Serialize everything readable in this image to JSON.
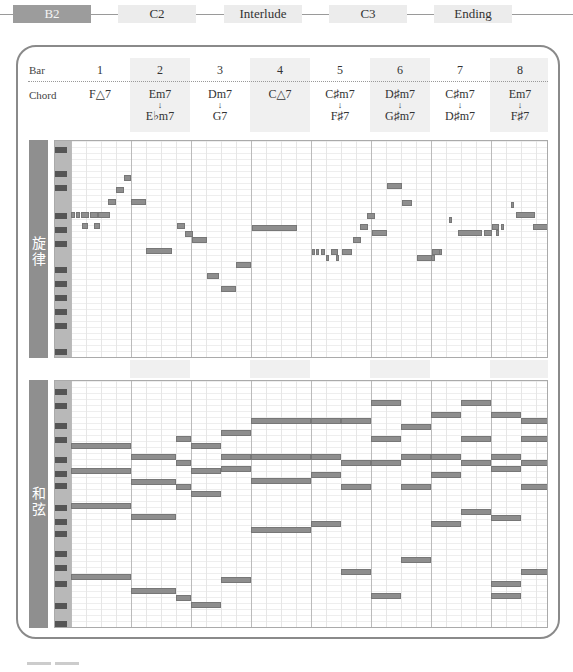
{
  "sections": [
    {
      "label": "B2",
      "active": true
    },
    {
      "label": "C2",
      "active": false
    },
    {
      "label": "Interlude",
      "active": false
    },
    {
      "label": "C3",
      "active": false
    },
    {
      "label": "Ending",
      "active": false
    }
  ],
  "header": {
    "bar_label": "Bar",
    "chord_label": "Chord",
    "bars": [
      "1",
      "2",
      "3",
      "4",
      "5",
      "6",
      "7",
      "8"
    ],
    "chords": [
      {
        "first": "F△7",
        "second": ""
      },
      {
        "first": "Em7",
        "second": "E♭m7"
      },
      {
        "first": "Dm7",
        "second": "G7"
      },
      {
        "first": "C△7",
        "second": ""
      },
      {
        "first": "C♯m7",
        "second": "F♯7"
      },
      {
        "first": "D♯m7",
        "second": "G♯m7"
      },
      {
        "first": "C♯m7",
        "second": "D♯m7"
      },
      {
        "first": "Em7",
        "second": "F♯7"
      }
    ],
    "arrow": "↓"
  },
  "melody": {
    "label_chars": [
      "旋",
      "律"
    ],
    "notes": [
      {
        "x": 0,
        "y": 71,
        "w": 4,
        "t": ""
      },
      {
        "x": 5,
        "y": 71,
        "w": 4,
        "t": ""
      },
      {
        "x": 10,
        "y": 71,
        "w": 8,
        "t": ""
      },
      {
        "x": 19,
        "y": 71,
        "w": 8,
        "t": ""
      },
      {
        "x": 27,
        "y": 71,
        "w": 12,
        "t": ""
      },
      {
        "x": 11,
        "y": 82,
        "w": 6,
        "t": ""
      },
      {
        "x": 23,
        "y": 82,
        "w": 6,
        "t": ""
      },
      {
        "x": 37,
        "y": 58,
        "w": 8,
        "t": ""
      },
      {
        "x": 45,
        "y": 46,
        "w": 8,
        "t": ""
      },
      {
        "x": 53,
        "y": 34,
        "w": 7,
        "t": ""
      },
      {
        "x": 60,
        "y": 58,
        "w": 15,
        "t": ""
      },
      {
        "x": 106,
        "y": 82,
        "w": 8,
        "t": ""
      },
      {
        "x": 114,
        "y": 90,
        "w": 8,
        "t": ""
      },
      {
        "x": 121,
        "y": 96,
        "w": 15,
        "t": ""
      },
      {
        "x": 75,
        "y": 107,
        "w": 26,
        "t": ""
      },
      {
        "x": 136,
        "y": 132,
        "w": 12,
        "t": ""
      },
      {
        "x": 150,
        "y": 145,
        "w": 15,
        "t": ""
      },
      {
        "x": 165,
        "y": 121,
        "w": 15,
        "t": ""
      },
      {
        "x": 181,
        "y": 84,
        "w": 45,
        "t": ""
      },
      {
        "x": 241,
        "y": 108,
        "w": 3,
        "t": ""
      },
      {
        "x": 245,
        "y": 108,
        "w": 3,
        "t": ""
      },
      {
        "x": 250,
        "y": 108,
        "w": 4,
        "t": ""
      },
      {
        "x": 255,
        "y": 114,
        "w": 3,
        "t": ""
      },
      {
        "x": 260,
        "y": 108,
        "w": 7,
        "t": ""
      },
      {
        "x": 265,
        "y": 114,
        "w": 3,
        "t": ""
      },
      {
        "x": 271,
        "y": 108,
        "w": 10,
        "t": ""
      },
      {
        "x": 282,
        "y": 96,
        "w": 8,
        "t": ""
      },
      {
        "x": 289,
        "y": 83,
        "w": 8,
        "t": ""
      },
      {
        "x": 296,
        "y": 72,
        "w": 8,
        "t": ""
      },
      {
        "x": 301,
        "y": 89,
        "w": 15,
        "t": ""
      },
      {
        "x": 316,
        "y": 42,
        "w": 15,
        "t": ""
      },
      {
        "x": 331,
        "y": 59,
        "w": 10,
        "t": ""
      },
      {
        "x": 346,
        "y": 114,
        "w": 15,
        "t": ""
      },
      {
        "x": 361,
        "y": 108,
        "w": 8,
        "t": ""
      },
      {
        "x": 360,
        "y": 114,
        "w": 4,
        "t": ""
      },
      {
        "x": 368,
        "y": 108,
        "w": 3,
        "t": ""
      },
      {
        "x": 378,
        "y": 76,
        "w": 3,
        "t": ""
      },
      {
        "x": 387,
        "y": 89,
        "w": 24,
        "t": ""
      },
      {
        "x": 413,
        "y": 89,
        "w": 8,
        "t": ""
      },
      {
        "x": 421,
        "y": 83,
        "w": 7,
        "t": ""
      },
      {
        "x": 425,
        "y": 89,
        "w": 3,
        "t": ""
      },
      {
        "x": 430,
        "y": 83,
        "w": 3,
        "t": ""
      },
      {
        "x": 440,
        "y": 61,
        "w": 3,
        "t": ""
      },
      {
        "x": 445,
        "y": 71,
        "w": 19,
        "t": ""
      },
      {
        "x": 462,
        "y": 83,
        "w": 15,
        "t": ""
      }
    ],
    "black_keys": [
      6,
      30,
      44,
      72,
      86,
      100,
      126,
      140,
      154,
      168,
      182,
      208,
      222
    ]
  },
  "chords_roll": {
    "label_chars": [
      "和",
      "弦"
    ],
    "notes": [
      {
        "x": 0,
        "y": 62,
        "w": 60,
        "t": ""
      },
      {
        "x": 0,
        "y": 87,
        "w": 60,
        "t": ""
      },
      {
        "x": 0,
        "y": 122,
        "w": 60,
        "t": ""
      },
      {
        "x": 0,
        "y": 193,
        "w": 60,
        "t": ""
      },
      {
        "x": 60,
        "y": 73,
        "w": 45,
        "t": ""
      },
      {
        "x": 60,
        "y": 98,
        "w": 45,
        "t": ""
      },
      {
        "x": 60,
        "y": 133,
        "w": 45,
        "t": ""
      },
      {
        "x": 60,
        "y": 207,
        "w": 45,
        "t": ""
      },
      {
        "x": 105,
        "y": 55,
        "w": 15,
        "t": ""
      },
      {
        "x": 105,
        "y": 79,
        "w": 15,
        "t": ""
      },
      {
        "x": 105,
        "y": 103,
        "w": 15,
        "t": ""
      },
      {
        "x": 105,
        "y": 214,
        "w": 15,
        "t": ""
      },
      {
        "x": 120,
        "y": 62,
        "w": 30,
        "t": ""
      },
      {
        "x": 120,
        "y": 87,
        "w": 30,
        "t": ""
      },
      {
        "x": 120,
        "y": 110,
        "w": 30,
        "t": ""
      },
      {
        "x": 120,
        "y": 221,
        "w": 30,
        "t": ""
      },
      {
        "x": 150,
        "y": 49,
        "w": 30,
        "t": ""
      },
      {
        "x": 150,
        "y": 73,
        "w": 30,
        "t": ""
      },
      {
        "x": 150,
        "y": 85,
        "w": 30,
        "t": ""
      },
      {
        "x": 150,
        "y": 196,
        "w": 30,
        "t": ""
      },
      {
        "x": 180,
        "y": 37,
        "w": 60,
        "t": ""
      },
      {
        "x": 180,
        "y": 73,
        "w": 60,
        "t": ""
      },
      {
        "x": 180,
        "y": 97,
        "w": 60,
        "t": ""
      },
      {
        "x": 180,
        "y": 146,
        "w": 60,
        "t": ""
      },
      {
        "x": 240,
        "y": 37,
        "w": 30,
        "t": ""
      },
      {
        "x": 240,
        "y": 73,
        "w": 30,
        "t": ""
      },
      {
        "x": 240,
        "y": 91,
        "w": 30,
        "t": ""
      },
      {
        "x": 240,
        "y": 140,
        "w": 30,
        "t": ""
      },
      {
        "x": 270,
        "y": 37,
        "w": 30,
        "t": ""
      },
      {
        "x": 270,
        "y": 79,
        "w": 30,
        "t": ""
      },
      {
        "x": 270,
        "y": 103,
        "w": 30,
        "t": ""
      },
      {
        "x": 270,
        "y": 188,
        "w": 30,
        "t": ""
      },
      {
        "x": 300,
        "y": 19,
        "w": 30,
        "t": ""
      },
      {
        "x": 300,
        "y": 55,
        "w": 30,
        "t": ""
      },
      {
        "x": 300,
        "y": 79,
        "w": 30,
        "t": ""
      },
      {
        "x": 300,
        "y": 212,
        "w": 30,
        "t": ""
      },
      {
        "x": 330,
        "y": 43,
        "w": 30,
        "t": ""
      },
      {
        "x": 330,
        "y": 73,
        "w": 30,
        "t": ""
      },
      {
        "x": 330,
        "y": 103,
        "w": 30,
        "t": ""
      },
      {
        "x": 330,
        "y": 176,
        "w": 30,
        "t": ""
      },
      {
        "x": 360,
        "y": 31,
        "w": 30,
        "t": ""
      },
      {
        "x": 360,
        "y": 73,
        "w": 30,
        "t": ""
      },
      {
        "x": 360,
        "y": 91,
        "w": 30,
        "t": ""
      },
      {
        "x": 360,
        "y": 140,
        "w": 30,
        "t": ""
      },
      {
        "x": 390,
        "y": 19,
        "w": 30,
        "t": ""
      },
      {
        "x": 390,
        "y": 55,
        "w": 30,
        "t": ""
      },
      {
        "x": 390,
        "y": 79,
        "w": 30,
        "t": ""
      },
      {
        "x": 390,
        "y": 128,
        "w": 30,
        "t": ""
      },
      {
        "x": 420,
        "y": 31,
        "w": 30,
        "t": ""
      },
      {
        "x": 420,
        "y": 73,
        "w": 30,
        "t": ""
      },
      {
        "x": 420,
        "y": 85,
        "w": 30,
        "t": ""
      },
      {
        "x": 420,
        "y": 134,
        "w": 30,
        "t": ""
      },
      {
        "x": 420,
        "y": 200,
        "w": 30,
        "t": ""
      },
      {
        "x": 450,
        "y": 37,
        "w": 28,
        "t": ""
      },
      {
        "x": 450,
        "y": 55,
        "w": 28,
        "t": ""
      },
      {
        "x": 450,
        "y": 79,
        "w": 28,
        "t": ""
      },
      {
        "x": 450,
        "y": 103,
        "w": 28,
        "t": ""
      },
      {
        "x": 450,
        "y": 188,
        "w": 28,
        "t": ""
      },
      {
        "x": 420,
        "y": 212,
        "w": 30,
        "t": ""
      }
    ],
    "black_keys": [
      8,
      22,
      42,
      56,
      76,
      90,
      102,
      124,
      138,
      150,
      170,
      184,
      200,
      222,
      240
    ]
  }
}
